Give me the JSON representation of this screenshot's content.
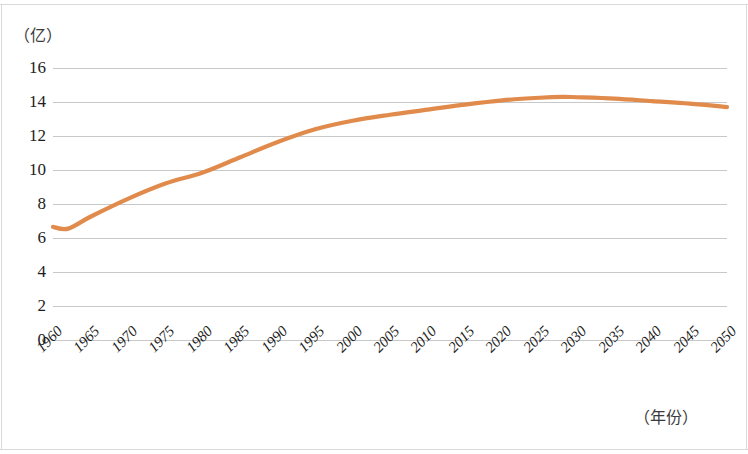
{
  "chart_data": {
    "type": "line",
    "title": "",
    "subtitle": "",
    "xlabel": "（年份）",
    "ylabel": "（亿）",
    "xlim": [
      1960,
      2050
    ],
    "ylim": [
      0,
      16
    ],
    "grid": true,
    "legend": null,
    "line_color": "#E08B4C",
    "x_tick_labels": [
      "1960",
      "1965",
      "1970",
      "1975",
      "1980",
      "1985",
      "1990",
      "1995",
      "2000",
      "2005",
      "2010",
      "2015",
      "2020",
      "2025",
      "2030",
      "2035",
      "2040",
      "2045",
      "2050"
    ],
    "y_tick_labels": [
      "16",
      "14",
      "12",
      "10",
      "8",
      "6",
      "4",
      "2",
      "0"
    ],
    "y_ticks": [
      16,
      14,
      12,
      10,
      8,
      6,
      4,
      2,
      0
    ],
    "x": [
      1960,
      1962,
      1965,
      1970,
      1975,
      1980,
      1985,
      1990,
      1995,
      2000,
      2005,
      2010,
      2015,
      2020,
      2025,
      2028,
      2030,
      2035,
      2040,
      2045,
      2050
    ],
    "values": [
      6.65,
      6.55,
      7.25,
      8.3,
      9.2,
      9.85,
      10.75,
      11.65,
      12.4,
      12.9,
      13.25,
      13.55,
      13.85,
      14.1,
      14.25,
      14.3,
      14.28,
      14.2,
      14.05,
      13.9,
      13.7
    ],
    "series": [
      {
        "name": "人口",
        "color": "#E08B4C",
        "values": [
          6.65,
          6.55,
          7.25,
          8.3,
          9.2,
          9.85,
          10.75,
          11.65,
          12.4,
          12.9,
          13.25,
          13.55,
          13.85,
          14.1,
          14.25,
          14.3,
          14.28,
          14.2,
          14.05,
          13.9,
          13.7
        ]
      }
    ]
  }
}
